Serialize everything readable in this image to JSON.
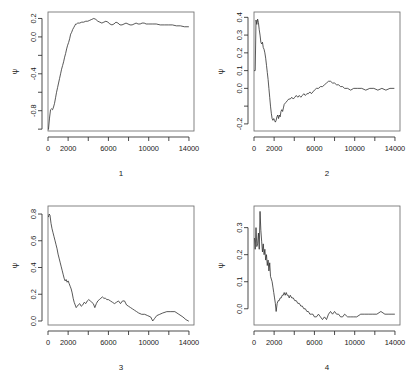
{
  "figure": {
    "type": "multi-panel-trace-plot",
    "panels": 4,
    "layout": "2x2",
    "background": "#ffffff",
    "line_color": "#2f2f2f",
    "axis_color": "#2b2b2b"
  },
  "chart_data": [
    {
      "type": "line",
      "title": "",
      "panel_label": "1",
      "xlabel": "1",
      "ylabel": "ψ",
      "xlim": [
        0,
        14500
      ],
      "ylim": [
        -1.02,
        0.27
      ],
      "grid": false,
      "legend": "none",
      "xticks": [
        0,
        2000,
        4000,
        6000,
        8000,
        10000,
        12000,
        14000
      ],
      "xticklabels": [
        "0",
        "2000",
        "",
        "6000",
        "",
        "10000",
        "",
        "14000"
      ],
      "yticks": [
        -1.0,
        -0.8,
        -0.6,
        -0.4,
        -0.2,
        0.0,
        0.2
      ],
      "yticklabels": [
        "",
        "-0.8",
        "",
        "-0.4",
        "",
        "0.0",
        "0.2"
      ],
      "x": [
        50,
        150,
        250,
        350,
        450,
        550,
        650,
        750,
        850,
        950,
        1050,
        1150,
        1250,
        1350,
        1450,
        1550,
        1650,
        1750,
        1850,
        1950,
        2050,
        2150,
        2250,
        2350,
        2450,
        2550,
        2650,
        2750,
        2850,
        2950,
        3150,
        3350,
        3550,
        3750,
        3950,
        4150,
        4350,
        4550,
        4750,
        4950,
        5150,
        5350,
        5550,
        5750,
        5950,
        6150,
        6350,
        6550,
        6750,
        6950,
        7150,
        7350,
        7550,
        7750,
        7950,
        8150,
        8350,
        8550,
        8750,
        8950,
        9150,
        9350,
        9550,
        9750,
        9950,
        10350,
        10750,
        11150,
        11550,
        11950,
        12350,
        12750,
        13150,
        13550,
        13950
      ],
      "y": [
        -1.0,
        -0.88,
        -0.79,
        -0.78,
        -0.79,
        -0.76,
        -0.72,
        -0.66,
        -0.6,
        -0.55,
        -0.5,
        -0.45,
        -0.4,
        -0.35,
        -0.31,
        -0.27,
        -0.22,
        -0.18,
        -0.13,
        -0.09,
        -0.06,
        -0.02,
        0.03,
        0.05,
        0.08,
        0.1,
        0.12,
        0.14,
        0.14,
        0.15,
        0.15,
        0.16,
        0.16,
        0.17,
        0.17,
        0.18,
        0.19,
        0.2,
        0.19,
        0.17,
        0.16,
        0.15,
        0.16,
        0.17,
        0.16,
        0.14,
        0.13,
        0.14,
        0.16,
        0.15,
        0.13,
        0.13,
        0.14,
        0.15,
        0.14,
        0.13,
        0.13,
        0.14,
        0.15,
        0.14,
        0.14,
        0.15,
        0.15,
        0.14,
        0.14,
        0.14,
        0.14,
        0.13,
        0.13,
        0.13,
        0.13,
        0.12,
        0.12,
        0.11,
        0.11
      ]
    },
    {
      "type": "line",
      "title": "",
      "panel_label": "2",
      "xlabel": "2",
      "ylabel": "ψ",
      "xlim": [
        0,
        14500
      ],
      "ylim": [
        -0.24,
        0.43
      ],
      "grid": false,
      "legend": "none",
      "xticks": [
        0,
        2000,
        4000,
        6000,
        8000,
        10000,
        12000,
        14000
      ],
      "xticklabels": [
        "0",
        "2000",
        "",
        "6000",
        "",
        "10000",
        "",
        "14000"
      ],
      "yticks": [
        -0.2,
        -0.1,
        0.0,
        0.1,
        0.2,
        0.3,
        0.4
      ],
      "yticklabels": [
        "-0.2",
        "",
        "0.0",
        "0.1",
        "0.2",
        "0.3",
        "0.4"
      ],
      "x": [
        50,
        120,
        200,
        280,
        360,
        440,
        520,
        600,
        680,
        760,
        840,
        920,
        1000,
        1080,
        1160,
        1240,
        1320,
        1400,
        1480,
        1560,
        1640,
        1720,
        1800,
        1880,
        1960,
        2040,
        2120,
        2200,
        2280,
        2360,
        2440,
        2520,
        2600,
        2680,
        2760,
        2840,
        2920,
        3000,
        3150,
        3300,
        3450,
        3600,
        3750,
        3900,
        4050,
        4200,
        4350,
        4500,
        4650,
        4800,
        4950,
        5100,
        5250,
        5400,
        5550,
        5700,
        5850,
        6000,
        6200,
        6400,
        6600,
        6800,
        7000,
        7200,
        7400,
        7600,
        7800,
        8000,
        8200,
        8400,
        8600,
        8800,
        9000,
        9300,
        9600,
        9900,
        10300,
        10700,
        11100,
        11500,
        11900,
        12300,
        12700,
        13100,
        13500,
        13900
      ],
      "y": [
        0.1,
        0.1,
        0.385,
        0.36,
        0.39,
        0.37,
        0.33,
        0.3,
        0.26,
        0.25,
        0.26,
        0.23,
        0.22,
        0.2,
        0.17,
        0.13,
        0.09,
        0.05,
        0.0,
        -0.05,
        -0.1,
        -0.14,
        -0.17,
        -0.18,
        -0.17,
        -0.18,
        -0.19,
        -0.18,
        -0.16,
        -0.15,
        -0.17,
        -0.15,
        -0.16,
        -0.13,
        -0.12,
        -0.13,
        -0.11,
        -0.09,
        -0.08,
        -0.07,
        -0.06,
        -0.06,
        -0.05,
        -0.06,
        -0.05,
        -0.04,
        -0.05,
        -0.04,
        -0.05,
        -0.04,
        -0.03,
        -0.04,
        -0.03,
        -0.03,
        -0.02,
        -0.03,
        -0.02,
        -0.01,
        0.0,
        0.0,
        0.01,
        0.01,
        0.02,
        0.03,
        0.04,
        0.04,
        0.03,
        0.03,
        0.02,
        0.02,
        0.01,
        0.01,
        0.0,
        0.0,
        -0.01,
        0.0,
        0.0,
        0.0,
        -0.01,
        0.0,
        0.0,
        -0.01,
        0.0,
        -0.01,
        0.0,
        0.0
      ]
    },
    {
      "type": "line",
      "title": "",
      "panel_label": "3",
      "xlabel": "3",
      "ylabel": "ψ",
      "xlim": [
        0,
        14500
      ],
      "ylim": [
        -0.03,
        0.86
      ],
      "grid": false,
      "legend": "none",
      "xticks": [
        0,
        2000,
        4000,
        6000,
        8000,
        10000,
        12000,
        14000
      ],
      "xticklabels": [
        "0",
        "2000",
        "",
        "6000",
        "",
        "10000",
        "",
        "14000"
      ],
      "yticks": [
        0.0,
        0.2,
        0.4,
        0.6,
        0.8
      ],
      "yticklabels": [
        "0.0",
        "0.2",
        "0.4",
        "0.6",
        "0.8"
      ],
      "x": [
        50,
        120,
        200,
        300,
        400,
        500,
        600,
        700,
        800,
        900,
        1000,
        1100,
        1200,
        1300,
        1400,
        1500,
        1600,
        1700,
        1800,
        1900,
        2000,
        2100,
        2200,
        2300,
        2400,
        2500,
        2600,
        2700,
        2800,
        2900,
        3000,
        3150,
        3300,
        3450,
        3600,
        3750,
        3900,
        4050,
        4200,
        4350,
        4500,
        4650,
        4800,
        4950,
        5100,
        5250,
        5400,
        5550,
        5700,
        5850,
        6000,
        6200,
        6400,
        6600,
        6800,
        7000,
        7200,
        7400,
        7600,
        7800,
        8000,
        8200,
        8400,
        8600,
        8800,
        9000,
        9300,
        9600,
        9900,
        10200,
        10400,
        10600,
        10800,
        11100,
        11400,
        11800,
        12200,
        12600,
        13000,
        13400,
        13700,
        13950
      ],
      "y": [
        0.78,
        0.8,
        0.79,
        0.73,
        0.69,
        0.66,
        0.63,
        0.6,
        0.57,
        0.54,
        0.5,
        0.47,
        0.44,
        0.41,
        0.38,
        0.35,
        0.32,
        0.3,
        0.31,
        0.29,
        0.3,
        0.28,
        0.26,
        0.24,
        0.21,
        0.17,
        0.14,
        0.12,
        0.1,
        0.11,
        0.12,
        0.13,
        0.11,
        0.12,
        0.14,
        0.13,
        0.15,
        0.16,
        0.15,
        0.14,
        0.13,
        0.1,
        0.13,
        0.15,
        0.16,
        0.17,
        0.18,
        0.17,
        0.17,
        0.16,
        0.16,
        0.15,
        0.14,
        0.13,
        0.14,
        0.15,
        0.13,
        0.15,
        0.15,
        0.12,
        0.11,
        0.1,
        0.09,
        0.08,
        0.07,
        0.06,
        0.05,
        0.05,
        0.04,
        0.03,
        0.0,
        0.02,
        0.04,
        0.05,
        0.06,
        0.07,
        0.07,
        0.07,
        0.05,
        0.03,
        0.01,
        0.0
      ]
    },
    {
      "type": "line",
      "title": "",
      "panel_label": "4",
      "xlabel": "4",
      "ylabel": "ψ",
      "xlim": [
        0,
        14500
      ],
      "ylim": [
        -0.06,
        0.38
      ],
      "grid": false,
      "legend": "none",
      "xticks": [
        0,
        2000,
        4000,
        6000,
        8000,
        10000,
        12000,
        14000
      ],
      "xticklabels": [
        "0",
        "2000",
        "",
        "6000",
        "",
        "10000",
        "",
        "14000"
      ],
      "yticks": [
        0.0,
        0.1,
        0.2,
        0.3
      ],
      "yticklabels": [
        "0.0",
        "0.1",
        "0.2",
        "0.3"
      ],
      "x": [
        50,
        120,
        200,
        280,
        360,
        440,
        520,
        600,
        680,
        760,
        840,
        920,
        1000,
        1080,
        1160,
        1240,
        1320,
        1400,
        1480,
        1560,
        1640,
        1720,
        1800,
        1880,
        1960,
        2040,
        2120,
        2200,
        2300,
        2400,
        2500,
        2600,
        2700,
        2800,
        2900,
        3000,
        3100,
        3200,
        3300,
        3400,
        3500,
        3600,
        3750,
        3900,
        4050,
        4200,
        4350,
        4500,
        4650,
        4800,
        4950,
        5100,
        5250,
        5400,
        5550,
        5700,
        5850,
        6000,
        6200,
        6400,
        6600,
        6800,
        7000,
        7200,
        7400,
        7600,
        7800,
        8000,
        8200,
        8400,
        8600,
        8800,
        9000,
        9300,
        9600,
        9900,
        10200,
        10600,
        11000,
        11400,
        11800,
        12200,
        12600,
        13000,
        13400,
        13700,
        13950
      ],
      "y": [
        0.26,
        0.22,
        0.3,
        0.23,
        0.24,
        0.28,
        0.22,
        0.36,
        0.29,
        0.25,
        0.21,
        0.24,
        0.2,
        0.22,
        0.18,
        0.2,
        0.16,
        0.18,
        0.14,
        0.17,
        0.12,
        0.11,
        0.1,
        0.08,
        0.06,
        0.04,
        0.02,
        -0.01,
        0.02,
        0.03,
        0.03,
        0.04,
        0.04,
        0.05,
        0.05,
        0.06,
        0.05,
        0.06,
        0.05,
        0.05,
        0.04,
        0.05,
        0.04,
        0.04,
        0.03,
        0.03,
        0.02,
        0.02,
        0.01,
        0.01,
        0.0,
        0.0,
        -0.01,
        -0.01,
        -0.02,
        -0.02,
        -0.02,
        -0.03,
        -0.03,
        -0.02,
        -0.03,
        -0.04,
        -0.03,
        -0.04,
        -0.02,
        -0.01,
        -0.02,
        -0.01,
        -0.02,
        -0.02,
        -0.03,
        -0.03,
        -0.02,
        -0.03,
        -0.03,
        -0.03,
        -0.03,
        -0.02,
        -0.02,
        -0.02,
        -0.02,
        -0.02,
        -0.01,
        -0.02,
        -0.02,
        -0.02,
        -0.02
      ]
    }
  ]
}
